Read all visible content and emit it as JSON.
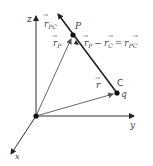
{
  "diagram": {
    "colors": {
      "axis": "#333333",
      "vector": "#666666",
      "rpc": "#222222",
      "label": "#444444",
      "dot": "#111111"
    },
    "points": {
      "origin": {
        "x": 36,
        "y": 116
      },
      "P": {
        "x": 73,
        "y": 35,
        "label": "P"
      },
      "C": {
        "x": 117,
        "y": 93,
        "label": "C",
        "charge_label": "q"
      }
    },
    "axes": {
      "z": {
        "label": "z",
        "end": {
          "x": 36,
          "y": 14
        }
      },
      "y": {
        "label": "y",
        "end": {
          "x": 136,
          "y": 116
        }
      },
      "x": {
        "label": "x",
        "end": {
          "x": 10,
          "y": 155
        }
      }
    },
    "vectors": {
      "r_P": {
        "label_main": "r",
        "label_sub": "P"
      },
      "r": {
        "label_main": "r",
        "label_sub": ""
      },
      "r_PC": {
        "label_main": "r",
        "label_sub": "PC"
      }
    },
    "equation": {
      "lhs_a": "r",
      "lhs_a_sub": "P",
      "minus": "−",
      "lhs_b": "r",
      "lhs_b_sub": "C",
      "equals": "=",
      "rhs": "r",
      "rhs_sub": "PC"
    },
    "arrow_symbol": "→"
  }
}
